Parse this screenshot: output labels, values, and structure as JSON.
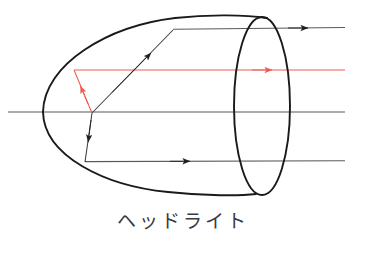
{
  "figure": {
    "caption": "ヘッドライト",
    "caption_romaji_meaning": "headlight",
    "background_color": "#ffffff"
  },
  "colors": {
    "outline": "#1a1a1a",
    "ray_black": "#3c3c42",
    "ray_red": "#ee5b52",
    "axis_gray": "#58585e",
    "caption": "#3a3a42"
  },
  "diagram": {
    "type": "optics-ray-diagram",
    "title": "ヘッドライト",
    "reflector": {
      "name": "parabolic-reflector",
      "vertex": {
        "x": 43,
        "y": 112
      },
      "rim_top": {
        "x": 267,
        "y": 18
      },
      "rim_bottom": {
        "x": 255,
        "y": 194
      },
      "stroke": "#1a1a1a",
      "stroke_width": 1.8
    },
    "aperture": {
      "name": "lens-opening-ellipse",
      "center": {
        "x": 262,
        "y": 106
      },
      "rx": 28,
      "ry": 89,
      "stroke": "#1a1a1a",
      "stroke_width": 1.8
    },
    "focus": {
      "x": 92,
      "y": 113,
      "label": "focal-point"
    },
    "rays": [
      {
        "id": "ray-upper-black",
        "color": "#3c3c42",
        "from": {
          "x": 92,
          "y": 113
        },
        "to": {
          "x": 173,
          "y": 30
        },
        "arrow_at": {
          "x": 150,
          "y": 54
        },
        "kind": "incident"
      },
      {
        "id": "ray-upper-parallel",
        "color": "#58585e",
        "from": {
          "x": 173,
          "y": 30
        },
        "to": {
          "x": 345,
          "y": 28
        },
        "arrow_at": {
          "x": 307,
          "y": 28
        },
        "kind": "reflected-parallel"
      },
      {
        "id": "ray-red-incident",
        "color": "#ee5b52",
        "from": {
          "x": 92,
          "y": 113
        },
        "to": {
          "x": 74,
          "y": 70
        },
        "arrow_at": {
          "x": 80,
          "y": 85
        },
        "kind": "incident"
      },
      {
        "id": "ray-red-parallel",
        "color": "#ee5b52",
        "from": {
          "x": 74,
          "y": 70
        },
        "to": {
          "x": 345,
          "y": 70
        },
        "arrow_at": {
          "x": 272,
          "y": 70
        },
        "kind": "reflected-parallel"
      },
      {
        "id": "ray-lower-black",
        "color": "#3c3c42",
        "from": {
          "x": 92,
          "y": 113
        },
        "to": {
          "x": 85,
          "y": 162
        },
        "arrow_at": {
          "x": 88,
          "y": 143
        },
        "kind": "incident"
      },
      {
        "id": "ray-lower-parallel",
        "color": "#58585e",
        "from": {
          "x": 85,
          "y": 162
        },
        "to": {
          "x": 345,
          "y": 161
        },
        "arrow_at": {
          "x": 190,
          "y": 161
        },
        "kind": "reflected-parallel"
      },
      {
        "id": "optical-axis",
        "color": "#58585e",
        "from": {
          "x": 8,
          "y": 112
        },
        "to": {
          "x": 345,
          "y": 112
        },
        "arrow_at": null,
        "kind": "axis"
      }
    ]
  }
}
